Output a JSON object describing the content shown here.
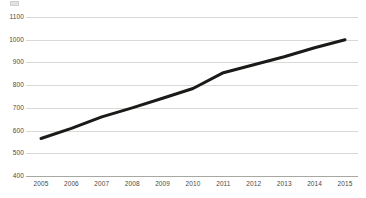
{
  "chart_data": {
    "type": "line",
    "title": "",
    "subtitle": "",
    "xlabel": "",
    "ylabel": "",
    "x": [
      2005,
      2006,
      2007,
      2008,
      2009,
      2010,
      2011,
      2012,
      2013,
      2014,
      2015
    ],
    "categories": [
      "2005",
      "2006",
      "2007",
      "2008",
      "2009",
      "2010",
      "2011",
      "2012",
      "2013",
      "2014",
      "2015"
    ],
    "series": [
      {
        "name": "",
        "color": "#1a1a18",
        "values": [
          565,
          610,
          660,
          700,
          742,
          785,
          855,
          890,
          925,
          965,
          1000
        ]
      }
    ],
    "ylim": [
      400,
      1100
    ],
    "yticks": [
      400,
      500,
      600,
      700,
      800,
      900,
      1000,
      1100
    ],
    "ytick_labels": [
      "400",
      "500",
      "600",
      "700",
      "800",
      "900",
      "1000",
      "1100"
    ],
    "xticks": [
      2005,
      2006,
      2007,
      2008,
      2009,
      2010,
      2011,
      2012,
      2013,
      2014,
      2015
    ],
    "xtick_labels": [
      "2005",
      "2006",
      "2007",
      "2008",
      "2009",
      "2010",
      "2011",
      "2012",
      "2013",
      "2014",
      "2015"
    ],
    "grid": "horizontal",
    "legend": "none",
    "gridline_color": "#d9d9d6",
    "axis_color": "#a8a8a2",
    "tick_label_color": "#4a4a46",
    "background_color": "#ffffff"
  },
  "axes": {
    "y_labels": [
      "1100",
      "1000",
      "900",
      "800",
      "700",
      "600",
      "500",
      "400"
    ],
    "x_labels": [
      "2005",
      "2006",
      "2007",
      "2008",
      "2009",
      "2010",
      "2011",
      "2012",
      "2013",
      "2014",
      "2015"
    ]
  }
}
